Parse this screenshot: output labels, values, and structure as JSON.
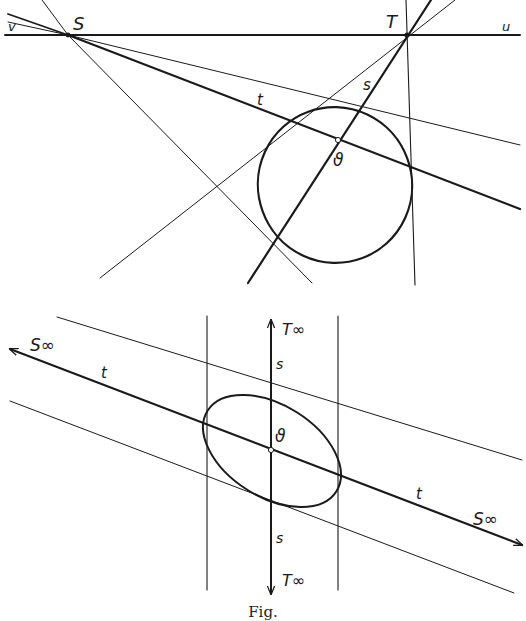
{
  "figure": {
    "caption": "Fig.",
    "colors": {
      "ink": "#1a1a1a",
      "background": "#ffffff"
    }
  },
  "top_panel": {
    "labels": {
      "v_left": "v",
      "S": "S",
      "T": "T",
      "u_right": "u",
      "t": "t",
      "s": "s",
      "center": "ϑ"
    },
    "points": {
      "S": [
        68,
        35
      ],
      "T": [
        407,
        35
      ],
      "center": [
        338,
        140
      ]
    },
    "ellipse": {
      "cx": 335,
      "cy": 185,
      "rx": 77,
      "ry": 78,
      "rotate": -20
    }
  },
  "bottom_panel": {
    "labels": {
      "S_inf_left": "S∞",
      "S_inf_right": "S∞",
      "T_inf_top": "T∞",
      "T_inf_bottom": "T∞",
      "t_left": "t",
      "t_right": "t",
      "s_top": "s",
      "s_bottom": "s",
      "center": "ϑ"
    },
    "points": {
      "center": [
        271,
        450
      ]
    },
    "ellipse": {
      "cx": 272,
      "cy": 451,
      "rx": 76,
      "ry": 46,
      "rotate": 30
    }
  }
}
